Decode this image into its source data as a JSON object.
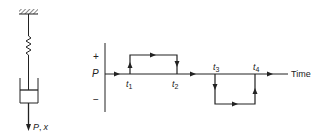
{
  "figure": {
    "mechanical_model": {
      "label_force": "P",
      "label_sep": ",",
      "label_disp": "x",
      "components": [
        "fixed-support",
        "spring",
        "dashpot",
        "force-arrow"
      ]
    },
    "load_history": {
      "axis_plus": "+",
      "axis_minus": "−",
      "axis_p": "P",
      "time_label": "Time",
      "ticks": [
        {
          "label": "t",
          "sub": "1"
        },
        {
          "label": "t",
          "sub": "2"
        },
        {
          "label": "t",
          "sub": "3"
        },
        {
          "label": "t",
          "sub": "4"
        }
      ],
      "segments": [
        {
          "from": "0",
          "to": "t1",
          "level": "0"
        },
        {
          "from": "t1",
          "to": "t2",
          "level": "+"
        },
        {
          "from": "t2",
          "to": "t3",
          "level": "0"
        },
        {
          "from": "t3",
          "to": "t4",
          "level": "−"
        },
        {
          "from": "t4",
          "to": "end",
          "level": "0"
        }
      ]
    },
    "line_color": "#222222"
  }
}
